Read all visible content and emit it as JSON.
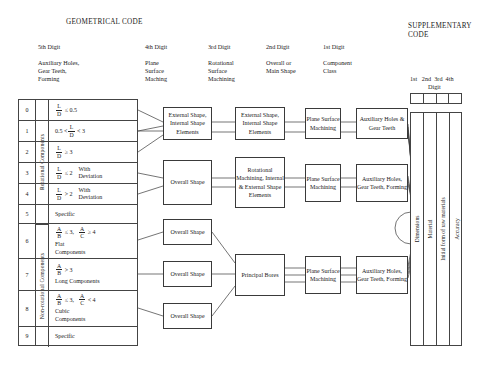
{
  "headers": {
    "geometrical_code": "GEOMETRICAL CODE",
    "supplementary_code": "SUPPLEMENTARY\nCODE",
    "columns": [
      {
        "digit": "5th Digit",
        "sub": "Auxiliary Holes,\nGear Teeth,\nForming"
      },
      {
        "digit": "4th Digit",
        "sub": "Plane\nSurface\nMaching"
      },
      {
        "digit": "3rd Digit",
        "sub": "Rotational\nSurface\nMachining"
      },
      {
        "digit": "2nd Digit",
        "sub": "Overall or\nMain Shape"
      },
      {
        "digit": "1st Digit",
        "sub": "Component\nClass"
      }
    ],
    "supp_digits": "1st   2nd  3rd  4th",
    "supp_digit_word": "Digit"
  },
  "matrix": {
    "groups": [
      {
        "label": "Rotational Components"
      },
      {
        "label": "Non-rotational Components"
      }
    ],
    "rows": [
      {
        "digit": "0",
        "kind": "frac",
        "num": "L",
        "den": "D",
        "op": "≤",
        "val": "0.5",
        "pre": "",
        "extra": "",
        "note": ""
      },
      {
        "digit": "1",
        "kind": "frac-range",
        "pre": "0.5 <",
        "num": "L",
        "den": "D",
        "op": "<",
        "val": "3",
        "extra": "",
        "note": ""
      },
      {
        "digit": "2",
        "kind": "frac",
        "num": "L",
        "den": "D",
        "op": "≥",
        "val": "3",
        "pre": "",
        "extra": "",
        "note": ""
      },
      {
        "digit": "3",
        "kind": "frac",
        "num": "L",
        "den": "D",
        "op": "≤",
        "val": "2",
        "pre": "",
        "extra": "With\nDeviation",
        "note": ""
      },
      {
        "digit": "4",
        "kind": "frac",
        "num": "L",
        "den": "D",
        "op": ">",
        "val": "2",
        "pre": "",
        "extra": "With\nDeviation",
        "note": ""
      },
      {
        "digit": "5",
        "kind": "text",
        "text": "Specific"
      },
      {
        "digit": "6",
        "kind": "frac2",
        "num1": "A",
        "den1": "B",
        "op1": "≤",
        "val1": "3,",
        "num2": "A",
        "den2": "C",
        "op2": "≥",
        "val2": "4",
        "note": "Flat\nComponents"
      },
      {
        "digit": "7",
        "kind": "frac1",
        "num1": "A",
        "den1": "B",
        "op1": ">",
        "val1": "3",
        "note": "Long Components"
      },
      {
        "digit": "8",
        "kind": "frac2",
        "num1": "A",
        "den1": "B",
        "op1": "≤",
        "val1": "3,",
        "num2": "A",
        "den2": "C",
        "op2": "<",
        "val2": "4",
        "note": "Cubic\nComponents"
      },
      {
        "digit": "9",
        "kind": "text",
        "text": "Specific"
      }
    ]
  },
  "boxes": {
    "b1_4th": "External Shape,\nInternal Shape\nElements",
    "b1_3rd": "External Shape,\nInternal Shape\nElements",
    "b1_2nd": "Plane\nSurface\nMachining",
    "b1_1st": "Auxiliary Holes\n&\nGear Teeth",
    "b2_4th": "Overall\nShape",
    "b2_3rd": "Rotational\nMachining,\nInternal &\nExternal Shape\nElements",
    "b2_2nd": "Plane\nSurface\nMachining",
    "b2_1st": "Auxiliary Holes,\nGear Teeth,\nForming",
    "b3_4th": "Overall\nShape",
    "b4_4th": "Overall\nShape",
    "b5_4th": "Overall\nShape",
    "b3_3rd": "Principal\nBores",
    "b3_2nd": "Plane\nSurface\nMachining",
    "b3_1st": "Auxiliary Holes,\nGear Teeth,\nForming"
  },
  "supplementary": {
    "columns": [
      "Dimensions",
      "Material",
      "Initial form of raw materials",
      "Accuracy"
    ]
  },
  "colors": {
    "line": "#3a3a3a",
    "background": "#ffffff",
    "text": "#1a1a1a"
  }
}
